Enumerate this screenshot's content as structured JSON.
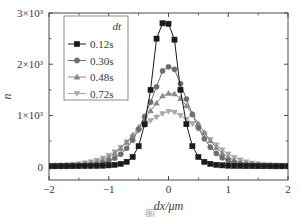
{
  "figure": {
    "background_color": "#ffffff",
    "frame_color": "#4a4a4a",
    "text_color": "#3a3a3a",
    "caption_partial": "图"
  },
  "chart_data": {
    "type": "line",
    "title": "",
    "subtitle": "",
    "xlabel": "dx/μm",
    "ylabel": "n",
    "xlim": [
      -2,
      2
    ],
    "ylim": [
      -260,
      3000
    ],
    "grid": false,
    "legend_position": "upper-left",
    "legend_title": "dt",
    "xticks": [
      -2,
      -1,
      0,
      1,
      2
    ],
    "xtick_labels": [
      "−2",
      "−1",
      "0",
      "1",
      "2"
    ],
    "yticks": [
      0,
      1000,
      2000,
      3000
    ],
    "ytick_labels": [
      "0",
      "1×10³",
      "2×10³",
      "3×10³"
    ],
    "x": [
      -2.0,
      -1.9,
      -1.8,
      -1.7,
      -1.6,
      -1.5,
      -1.4,
      -1.3,
      -1.2,
      -1.1,
      -1.0,
      -0.9,
      -0.8,
      -0.7,
      -0.6,
      -0.5,
      -0.4,
      -0.3,
      -0.2,
      -0.1,
      0.0,
      0.1,
      0.2,
      0.3,
      0.4,
      0.5,
      0.6,
      0.7,
      0.8,
      0.9,
      1.0,
      1.1,
      1.2,
      1.3,
      1.4,
      1.5,
      1.6,
      1.7,
      1.8,
      1.9,
      2.0
    ],
    "series": [
      {
        "name": "0.12s",
        "label": "0.12s",
        "color": "#1a1a1a",
        "marker": "square",
        "values": [
          8,
          8,
          9,
          9,
          10,
          11,
          12,
          14,
          16,
          20,
          26,
          36,
          55,
          95,
          190,
          400,
          830,
          1500,
          2500,
          2800,
          2790,
          2480,
          1500,
          830,
          400,
          190,
          95,
          55,
          36,
          26,
          20,
          16,
          14,
          12,
          11,
          10,
          9,
          9,
          8,
          8,
          8
        ]
      },
      {
        "name": "0.30s",
        "label": "0.30s",
        "color": "#6e6e6e",
        "marker": "circle",
        "values": [
          12,
          13,
          14,
          16,
          19,
          23,
          29,
          38,
          52,
          74,
          110,
          165,
          245,
          360,
          520,
          730,
          980,
          1260,
          1560,
          1870,
          1950,
          1900,
          1620,
          1320,
          1020,
          760,
          545,
          380,
          258,
          175,
          118,
          80,
          56,
          41,
          31,
          25,
          20,
          17,
          15,
          13,
          12
        ]
      },
      {
        "name": "0.48s",
        "label": "0.48s",
        "color": "#8a8a8a",
        "marker": "triangle-up",
        "values": [
          18,
          20,
          23,
          27,
          33,
          41,
          53,
          70,
          95,
          132,
          185,
          258,
          355,
          475,
          615,
          770,
          930,
          1090,
          1240,
          1380,
          1430,
          1420,
          1330,
          1190,
          1020,
          840,
          665,
          505,
          370,
          262,
          182,
          126,
          88,
          63,
          47,
          36,
          29,
          24,
          21,
          19,
          18
        ]
      },
      {
        "name": "0.72s",
        "label": "0.72s",
        "color": "#a8a8a8",
        "marker": "triangle-down",
        "values": [
          25,
          28,
          32,
          38,
          46,
          57,
          73,
          95,
          125,
          167,
          222,
          292,
          378,
          478,
          588,
          700,
          808,
          900,
          968,
          1035,
          1080,
          1065,
          1000,
          925,
          840,
          745,
          640,
          530,
          425,
          330,
          248,
          182,
          132,
          96,
          71,
          54,
          42,
          34,
          29,
          26,
          25
        ]
      }
    ]
  }
}
